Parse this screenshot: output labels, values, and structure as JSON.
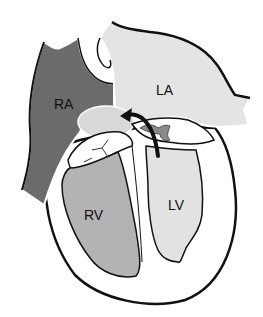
{
  "diagram": {
    "type": "heart-cross-section",
    "labels": {
      "ra": "RA",
      "la": "LA",
      "rv": "RV",
      "lv": "LV"
    },
    "colors": {
      "background": "#ffffff",
      "ra_fill": "#6b6b6b",
      "la_fill": "#e4e4e4",
      "rv_fill": "#b3b3b3",
      "lv_fill": "#e2e2e2",
      "outline": "#111111",
      "valve_fill": "#8a8a8a",
      "aorta_fill": "#d9d9d9"
    }
  }
}
